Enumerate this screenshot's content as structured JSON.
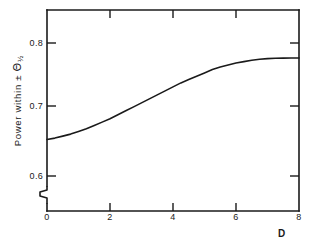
{
  "chart_data": {
    "type": "line",
    "title": "",
    "subtitle": "",
    "xlabel": "D",
    "ylabel": "Power  within  ±  Θ½",
    "ylabel_parts": {
      "prefix": "Power  within  ± ",
      "symbol": "Θ",
      "subscript": "½"
    },
    "xlim": [
      0,
      8
    ],
    "ylim": [
      0.555,
      0.838
    ],
    "y_axis_break": true,
    "y_break_note": "zigzag axis-break mark on the left axis just below 0.6",
    "grid": false,
    "legend": null,
    "xticks": [
      0,
      2,
      4,
      6,
      8
    ],
    "xtick_labels": [
      "0",
      "2",
      "4",
      "6",
      "8"
    ],
    "yticks": [
      0.6,
      0.7,
      0.8
    ],
    "ytick_labels": [
      "0.6",
      "0.7",
      "0.8"
    ],
    "ticks_on_all_four_sides": true,
    "line_color": "#1a1a1a",
    "line_width": 1.6,
    "x": [
      0.0,
      0.25,
      0.5,
      0.75,
      1.0,
      1.25,
      1.5,
      1.75,
      2.0,
      2.25,
      2.5,
      2.75,
      3.0,
      3.25,
      3.5,
      3.75,
      4.0,
      4.25,
      4.5,
      4.75,
      5.0,
      5.25,
      5.5,
      5.75,
      6.0,
      6.25,
      6.5,
      6.75,
      7.0,
      7.25,
      7.5,
      7.75,
      8.0
    ],
    "y": [
      0.655,
      0.657,
      0.66,
      0.663,
      0.667,
      0.671,
      0.676,
      0.681,
      0.686,
      0.692,
      0.698,
      0.704,
      0.71,
      0.716,
      0.722,
      0.728,
      0.734,
      0.74,
      0.745,
      0.75,
      0.755,
      0.76,
      0.764,
      0.767,
      0.77,
      0.772,
      0.774,
      0.7755,
      0.7765,
      0.777,
      0.7773,
      0.7775,
      0.7775
    ],
    "series": [
      {
        "name": "Power within ± Θ½",
        "values": [
          0.655,
          0.657,
          0.66,
          0.663,
          0.667,
          0.671,
          0.676,
          0.681,
          0.686,
          0.692,
          0.698,
          0.704,
          0.71,
          0.716,
          0.722,
          0.728,
          0.734,
          0.74,
          0.745,
          0.75,
          0.755,
          0.76,
          0.764,
          0.767,
          0.77,
          0.772,
          0.774,
          0.7755,
          0.7765,
          0.777,
          0.7773,
          0.7775,
          0.7775
        ]
      }
    ],
    "annotations": []
  }
}
